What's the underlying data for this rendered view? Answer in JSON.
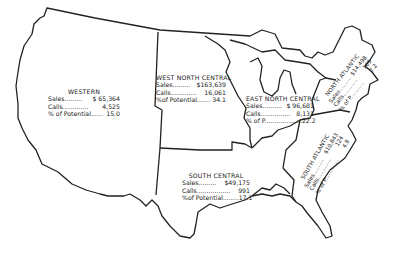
{
  "regions": [
    {
      "id": "western",
      "name": "WESTERN",
      "rows": [
        {
          "label": "Sales.........",
          "value": "$ 65,364"
        },
        {
          "label": "Calls.............",
          "value": "4,525"
        },
        {
          "label": "% of Potential......",
          "value": "15.0"
        }
      ]
    },
    {
      "id": "west-north-central",
      "name": "WEST NORTH CENTRAL",
      "rows": [
        {
          "label": "Sales.........",
          "value": "$163,639"
        },
        {
          "label": "Calls.............",
          "value": "16,061"
        },
        {
          "label": "%of Potential.......",
          "value": "34.1"
        }
      ]
    },
    {
      "id": "east-north-central",
      "name": "EAST NORTH CENTRAL",
      "rows": [
        {
          "label": "Sales..........",
          "value": "$ 96,681"
        },
        {
          "label": "Calls...............",
          "value": "8,131"
        },
        {
          "label": "% of P...................",
          "value": "22.2"
        }
      ]
    },
    {
      "id": "north-atlantic",
      "name": "NORTH ATLANTIC",
      "rows": [
        {
          "label": "Sales..........",
          "value": "$14,498"
        },
        {
          "label": "Calls............",
          "value": "169"
        },
        {
          "label": "% of P...........",
          "value": "7.2"
        }
      ]
    },
    {
      "id": "south-atlantic",
      "name": "SOUTH ATLANTIC",
      "rows": [
        {
          "label": "Sales..........",
          "value": "$10,643"
        },
        {
          "label": "Calls.............",
          "value": "124"
        },
        {
          "label": "% of P.............",
          "value": "4.8"
        }
      ]
    },
    {
      "id": "south-central",
      "name": "SOUTH CENTRAL",
      "rows": [
        {
          "label": "Sales.........",
          "value": "$49,175"
        },
        {
          "label": "Calls.................",
          "value": "991"
        },
        {
          "label": "%of Potential........",
          "value": "17.1"
        }
      ]
    }
  ]
}
